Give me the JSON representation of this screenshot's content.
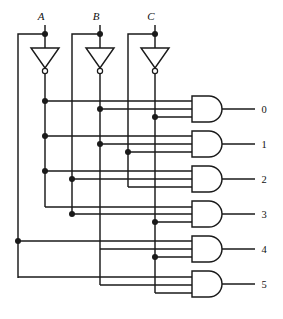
{
  "diagram": {
    "type": "logic-circuit",
    "line_color": "#1a1a1a",
    "background_color": "#ffffff"
  },
  "inputs": [
    {
      "id": "A",
      "label": "A",
      "x": 45,
      "y": 20,
      "tap_y": 34,
      "true_rail_x": 18,
      "comp_rail_x": 45
    },
    {
      "id": "B",
      "label": "B",
      "x": 100,
      "y": 20,
      "tap_y": 34,
      "true_rail_x": 72,
      "comp_rail_x": 100
    },
    {
      "id": "C",
      "label": "C",
      "x": 155,
      "y": 20,
      "tap_y": 34,
      "true_rail_x": 128,
      "comp_rail_x": 155
    }
  ],
  "inverters": [
    {
      "id": "inv-a",
      "name": "inverter-a",
      "input": "A",
      "output": "A-not",
      "cx": 45,
      "top_y": 48,
      "bottom_y": 72
    },
    {
      "id": "inv-b",
      "name": "inverter-b",
      "input": "B",
      "output": "B-not",
      "cx": 100,
      "top_y": 48,
      "bottom_y": 72
    },
    {
      "id": "inv-c",
      "name": "inverter-c",
      "input": "C",
      "output": "C-not",
      "cx": 155,
      "top_y": 48,
      "bottom_y": 72
    }
  ],
  "rails": [
    {
      "name": "rail-a-true",
      "signal": "A",
      "x": 18
    },
    {
      "name": "rail-a-not",
      "signal": "A'",
      "x": 45
    },
    {
      "name": "rail-b-true",
      "signal": "B",
      "x": 72
    },
    {
      "name": "rail-b-not",
      "signal": "B'",
      "x": 100
    },
    {
      "name": "rail-c-true",
      "signal": "C",
      "x": 128
    },
    {
      "name": "rail-c-not",
      "signal": "C'",
      "x": 155
    }
  ],
  "gates": [
    {
      "id": "gate0",
      "name": "and-gate-0",
      "output_label": "0",
      "minterm": "A' B' C'",
      "left_x": 192,
      "top_y": 96,
      "height": 26,
      "body_w": 34,
      "output_line_end": 255,
      "label_x": 264,
      "input_wires": [
        {
          "signal": "A'",
          "from_x": 45,
          "y": 101
        },
        {
          "signal": "B'",
          "from_x": 100,
          "y": 109
        },
        {
          "signal": "C'",
          "from_x": 155,
          "y": 117
        }
      ]
    },
    {
      "id": "gate1",
      "name": "and-gate-1",
      "output_label": "1",
      "minterm": "A' B' C",
      "left_x": 192,
      "top_y": 131,
      "height": 26,
      "body_w": 34,
      "output_line_end": 255,
      "label_x": 264,
      "input_wires": [
        {
          "signal": "A'",
          "from_x": 45,
          "y": 136
        },
        {
          "signal": "B'",
          "from_x": 100,
          "y": 144
        },
        {
          "signal": "C",
          "from_x": 128,
          "y": 152
        }
      ]
    },
    {
      "id": "gate2",
      "name": "and-gate-2",
      "output_label": "2",
      "minterm": "A' B C'",
      "left_x": 192,
      "top_y": 166,
      "height": 26,
      "body_w": 34,
      "output_line_end": 255,
      "label_x": 264,
      "input_wires": [
        {
          "signal": "A'",
          "from_x": 45,
          "y": 171
        },
        {
          "signal": "B",
          "from_x": 72,
          "y": 179
        },
        {
          "signal": "C'",
          "from_x": 128,
          "y": 187
        }
      ]
    },
    {
      "id": "gate3",
      "name": "and-gate-3",
      "output_label": "3",
      "minterm": "A' B C",
      "left_x": 192,
      "top_y": 201,
      "height": 26,
      "body_w": 34,
      "output_line_end": 255,
      "label_x": 264,
      "input_wires": [
        {
          "signal": "A'",
          "from_x": 45,
          "y": 206
        },
        {
          "signal": "B",
          "from_x": 72,
          "y": 214
        },
        {
          "signal": "C'",
          "from_x": 155,
          "y": 222
        }
      ]
    },
    {
      "id": "gate4",
      "name": "and-gate-4",
      "output_label": "4",
      "minterm": "A B' C'",
      "left_x": 192,
      "top_y": 236,
      "height": 26,
      "body_w": 34,
      "output_line_end": 255,
      "label_x": 264,
      "input_wires": [
        {
          "signal": "A",
          "from_x": 18,
          "y": 241
        },
        {
          "signal": "B'",
          "from_x": 100,
          "y": 249
        },
        {
          "signal": "C'",
          "from_x": 155,
          "y": 257
        }
      ]
    },
    {
      "id": "gate5",
      "name": "and-gate-5",
      "output_label": "5",
      "minterm": "A B' C",
      "left_x": 192,
      "top_y": 271,
      "height": 26,
      "body_w": 34,
      "output_line_end": 255,
      "label_x": 264,
      "input_wires": [
        {
          "signal": "A",
          "from_x": 18,
          "y": 277
        },
        {
          "signal": "B'",
          "from_x": 100,
          "y": 285
        },
        {
          "signal": "C",
          "from_x": 155,
          "y": 293
        }
      ]
    }
  ],
  "outputs": [
    {
      "label": "0",
      "y": 109
    },
    {
      "label": "1",
      "y": 144
    },
    {
      "label": "2",
      "y": 179
    },
    {
      "label": "3",
      "y": 214
    },
    {
      "label": "4",
      "y": 249
    },
    {
      "label": "5",
      "y": 284
    }
  ],
  "junctions": [
    {
      "name": "junction-a-tap",
      "x": 45,
      "y": 34
    },
    {
      "name": "junction-b-tap",
      "x": 100,
      "y": 34
    },
    {
      "name": "junction-c-tap",
      "x": 155,
      "y": 34
    },
    {
      "name": "junction-anot-g0",
      "x": 45,
      "y": 101
    },
    {
      "name": "junction-bnot-g0",
      "x": 100,
      "y": 109
    },
    {
      "name": "junction-cnot-g0",
      "x": 155,
      "y": 117
    },
    {
      "name": "junction-anot-g1",
      "x": 45,
      "y": 136
    },
    {
      "name": "junction-bnot-g1",
      "x": 100,
      "y": 144
    },
    {
      "name": "junction-c-g1",
      "x": 128,
      "y": 152
    },
    {
      "name": "junction-anot-g2",
      "x": 45,
      "y": 171
    },
    {
      "name": "junction-b-g2",
      "x": 72,
      "y": 179
    },
    {
      "name": "junction-b-g3",
      "x": 72,
      "y": 214
    },
    {
      "name": "junction-cnot-g3",
      "x": 155,
      "y": 222
    },
    {
      "name": "junction-a-g4",
      "x": 18,
      "y": 241
    },
    {
      "name": "junction-cnot-g4",
      "x": 155,
      "y": 257
    }
  ]
}
